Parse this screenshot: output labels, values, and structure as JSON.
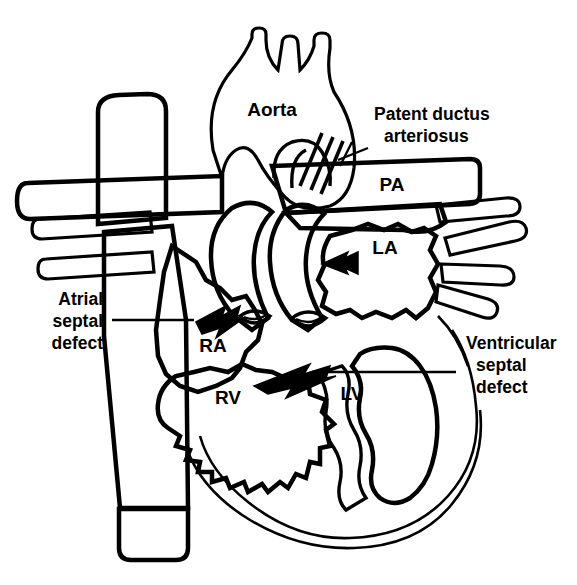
{
  "colors": {
    "ink": "#000000",
    "background": "#ffffff",
    "deoxygenated_gray": "#6e6e6e",
    "chamber_gray": "#b5b5b5",
    "vessel_white": "#ffffff"
  },
  "chamber_labels": [
    {
      "id": "ra",
      "text": "RA",
      "x": 213,
      "y": 352
    },
    {
      "id": "rv",
      "text": "RV",
      "x": 228,
      "y": 404
    },
    {
      "id": "lv",
      "text": "LV",
      "x": 352,
      "y": 400
    },
    {
      "id": "la",
      "text": "LA",
      "x": 385,
      "y": 254
    }
  ],
  "vessel_labels": [
    {
      "id": "aorta",
      "text": "Aorta",
      "x": 272,
      "y": 116
    },
    {
      "id": "pa",
      "text": "PA",
      "x": 392,
      "y": 191
    }
  ],
  "callouts": [
    {
      "id": "patent-ductus-arteriosus",
      "lines": [
        "Patent ductus",
        "arteriosus"
      ],
      "text": "Patent ductus arteriosus",
      "x": 374,
      "y": 120,
      "align": "start"
    },
    {
      "id": "atrial-septal-defect",
      "lines": [
        "Atrial",
        "septal",
        "defect"
      ],
      "text": "Atrial septal defect",
      "x": 103,
      "y": 319,
      "align": "end"
    },
    {
      "id": "ventricular-septal-defect",
      "lines": [
        "Ventricular",
        "septal",
        "defect"
      ],
      "text": "Ventricular septal defect",
      "x": 466,
      "y": 357,
      "align": "start"
    }
  ],
  "shunt_arrows": [
    {
      "id": "asd-arrow",
      "points_to": "right atrium",
      "direction": "left"
    },
    {
      "id": "vsd-arrow",
      "points_to": "right ventricle",
      "direction": "left"
    },
    {
      "id": "pfo-la-arrow",
      "points_to": "left atrium",
      "direction": "left"
    }
  ],
  "structures": [
    "superior vena cava",
    "inferior vena cava",
    "aortic arch with brachiocephalic branches",
    "pulmonary artery",
    "pulmonary veins",
    "tricuspid valve",
    "mitral valve",
    "interatrial septum",
    "interventricular septum"
  ]
}
